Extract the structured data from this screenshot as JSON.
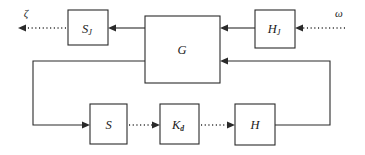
{
  "diagram": {
    "type": "block-diagram",
    "background_color": "#ffffff",
    "line_color": "#2a2a2a",
    "blocks": [
      {
        "id": "S_J",
        "label": "S",
        "subscript": "J",
        "x": 68,
        "y": 10,
        "w": 40,
        "h": 35
      },
      {
        "id": "G",
        "label": "G",
        "subscript": "",
        "x": 145,
        "y": 16,
        "w": 75,
        "h": 67
      },
      {
        "id": "H_J",
        "label": "H",
        "subscript": "J",
        "x": 255,
        "y": 10,
        "w": 40,
        "h": 38
      },
      {
        "id": "S",
        "label": "S",
        "subscript": "",
        "x": 90,
        "y": 104,
        "w": 37,
        "h": 40
      },
      {
        "id": "K_d",
        "label": "K",
        "subscript": "d",
        "x": 160,
        "y": 104,
        "w": 39,
        "h": 40
      },
      {
        "id": "H",
        "label": "H",
        "subscript": "",
        "x": 235,
        "y": 104,
        "w": 40,
        "h": 41
      }
    ],
    "signals": [
      {
        "id": "output-zeta",
        "label": "ζ",
        "x": 26,
        "y": 12
      },
      {
        "id": "input-omega",
        "label": "ω",
        "x": 339,
        "y": 12
      }
    ],
    "connections": [
      {
        "id": "zeta-out",
        "style": "dotted",
        "from": "S_J",
        "to": "zeta-terminal"
      },
      {
        "id": "g-to-sj",
        "style": "solid",
        "from": "G",
        "to": "S_J"
      },
      {
        "id": "hj-to-g",
        "style": "solid",
        "from": "H_J",
        "to": "G"
      },
      {
        "id": "omega-in",
        "style": "dotted",
        "from": "omega-terminal",
        "to": "H_J"
      },
      {
        "id": "g-to-s",
        "style": "solid",
        "from": "G",
        "to": "S"
      },
      {
        "id": "s-to-kd",
        "style": "dotted",
        "from": "S",
        "to": "K_d"
      },
      {
        "id": "kd-to-h",
        "style": "dotted",
        "from": "K_d",
        "to": "H"
      },
      {
        "id": "h-to-g",
        "style": "solid",
        "from": "H",
        "to": "G"
      }
    ]
  }
}
